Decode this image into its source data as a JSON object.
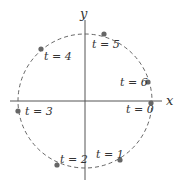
{
  "diagram": {
    "axes": {
      "x_label": "x",
      "y_label": "y"
    },
    "circle": {
      "center": [
        85,
        101
      ],
      "radius": 67,
      "stroke": "#666666",
      "dashed": true
    },
    "colors": {
      "axis": "#555555",
      "point": "#666666",
      "text": "#333333"
    },
    "points": [
      {
        "label": "t = 0",
        "x": 151,
        "y": 103,
        "lx": 126,
        "ly": 113
      },
      {
        "label": "t = 1",
        "x": 120,
        "y": 160,
        "lx": 96,
        "ly": 158
      },
      {
        "label": "t = 2",
        "x": 57,
        "y": 165,
        "lx": 60,
        "ly": 163
      },
      {
        "label": "t = 3",
        "x": 18,
        "y": 111,
        "lx": 25,
        "ly": 115
      },
      {
        "label": "t = 4",
        "x": 41,
        "y": 49,
        "lx": 44,
        "ly": 60
      },
      {
        "label": "t = 5",
        "x": 104,
        "y": 34,
        "lx": 92,
        "ly": 48
      },
      {
        "label": "t = 6",
        "x": 148,
        "y": 82,
        "lx": 120,
        "ly": 86
      }
    ]
  }
}
